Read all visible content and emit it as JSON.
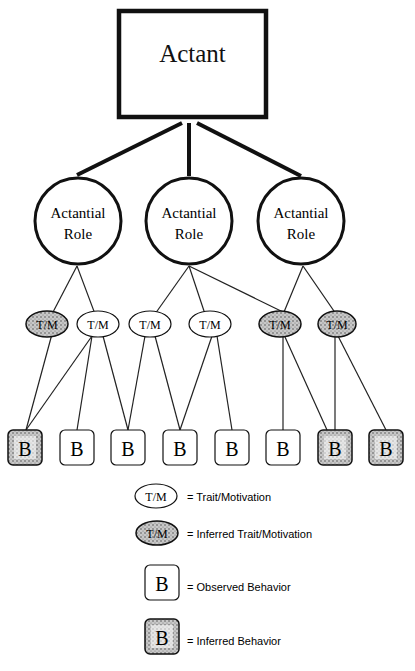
{
  "diagram": {
    "root": {
      "label": "Actant"
    },
    "roles": [
      {
        "id": "r1",
        "line1": "Actantial",
        "line2": "Role",
        "cx": 77,
        "cy": 220
      },
      {
        "id": "r2",
        "line1": "Actantial",
        "line2": "Role",
        "cx": 189,
        "cy": 220
      },
      {
        "id": "r3",
        "line1": "Actantial",
        "line2": "Role",
        "cx": 301,
        "cy": 220
      }
    ],
    "traits": [
      {
        "id": "t1",
        "label": "T/M",
        "inferred": true,
        "cx": 47,
        "cy": 324
      },
      {
        "id": "t2",
        "label": "T/M",
        "inferred": false,
        "cx": 97,
        "cy": 324
      },
      {
        "id": "t3",
        "label": "T/M",
        "inferred": false,
        "cx": 149,
        "cy": 324
      },
      {
        "id": "t4",
        "label": "T/M",
        "inferred": false,
        "cx": 210,
        "cy": 324
      },
      {
        "id": "t5",
        "label": "T/M",
        "inferred": true,
        "cx": 280,
        "cy": 324
      },
      {
        "id": "t6",
        "label": "T/M",
        "inferred": true,
        "cx": 337,
        "cy": 324
      }
    ],
    "behaviors": [
      {
        "id": "b1",
        "label": "B",
        "inferred": true,
        "cx": 25
      },
      {
        "id": "b2",
        "label": "B",
        "inferred": false,
        "cx": 77
      },
      {
        "id": "b3",
        "label": "B",
        "inferred": false,
        "cx": 128
      },
      {
        "id": "b4",
        "label": "B",
        "inferred": false,
        "cx": 180
      },
      {
        "id": "b5",
        "label": "B",
        "inferred": false,
        "cx": 232
      },
      {
        "id": "b6",
        "label": "B",
        "inferred": false,
        "cx": 283
      },
      {
        "id": "b7",
        "label": "B",
        "inferred": true,
        "cx": 335
      },
      {
        "id": "b8",
        "label": "B",
        "inferred": true,
        "cx": 386
      }
    ],
    "edges": {
      "root_to_roles": [
        "r1",
        "r2",
        "r3"
      ],
      "role_to_trait": [
        [
          "r1",
          "t1"
        ],
        [
          "r1",
          "t2"
        ],
        [
          "r2",
          "t3"
        ],
        [
          "r2",
          "t4"
        ],
        [
          "r2",
          "t5"
        ],
        [
          "r3",
          "t5"
        ],
        [
          "r3",
          "t6"
        ]
      ],
      "trait_to_behavior": [
        [
          "t1",
          "b1"
        ],
        [
          "t2",
          "b1"
        ],
        [
          "t2",
          "b2"
        ],
        [
          "t2",
          "b3"
        ],
        [
          "t3",
          "b3"
        ],
        [
          "t3",
          "b4"
        ],
        [
          "t4",
          "b4"
        ],
        [
          "t4",
          "b5"
        ],
        [
          "t5",
          "b6"
        ],
        [
          "t5",
          "b7"
        ],
        [
          "t6",
          "b7"
        ],
        [
          "t6",
          "b8"
        ]
      ]
    }
  },
  "legend": {
    "items": [
      {
        "symbol": "T/M",
        "text": "= Trait/Motivation"
      },
      {
        "symbol": "T/M",
        "text": "= Inferred Trait/Motivation"
      },
      {
        "symbol": "B",
        "text": "= Observed Behavior"
      },
      {
        "symbol": "B",
        "text": "= Inferred Behavior"
      }
    ]
  }
}
